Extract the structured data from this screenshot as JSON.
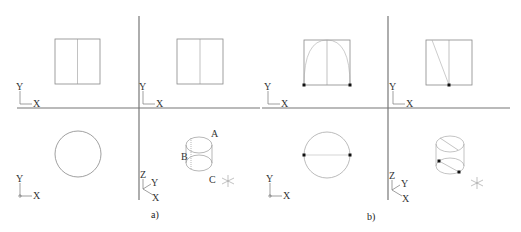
{
  "panels": [
    {
      "caption": "a)",
      "point_labels": {
        "A": "A",
        "B": "B",
        "C": "C"
      }
    },
    {
      "caption": "b)"
    }
  ],
  "axes": {
    "x": "X",
    "y": "Y",
    "z": "Z"
  },
  "colors": {
    "frame": "#777777",
    "shape": "#888888",
    "point": "#111111"
  }
}
